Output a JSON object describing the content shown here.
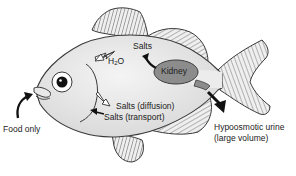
{
  "diagram": {
    "colors": {
      "body": "#e4e4e4",
      "outline": "#3a3a3a",
      "kidney": "#8c8c8c",
      "fin": "#ececec",
      "arrow_solid": "#111111",
      "arrow_hollow": "#ffffff"
    },
    "labels": {
      "salts_top": "Salts",
      "water": "H",
      "water_sub": "2",
      "water_tail": "O",
      "kidney": "Kidney",
      "salts_diffusion": "Salts (diffusion)",
      "salts_transport": "Salts (transport)",
      "food": "Food only",
      "urine_line1": "Hypoosmotic urine",
      "urine_line2": "(large volume)"
    },
    "arrows": [
      {
        "name": "water-in",
        "style": "hollow",
        "direction": "into body"
      },
      {
        "name": "salts-out-top",
        "style": "solid",
        "direction": "out from kidney"
      },
      {
        "name": "salts-diffusion-out",
        "style": "hollow",
        "direction": "out of gills"
      },
      {
        "name": "salts-transport-in",
        "style": "solid",
        "direction": "into gills"
      },
      {
        "name": "food-in",
        "style": "solid",
        "direction": "into mouth"
      },
      {
        "name": "urine-out",
        "style": "solid",
        "direction": "out of body"
      }
    ]
  }
}
